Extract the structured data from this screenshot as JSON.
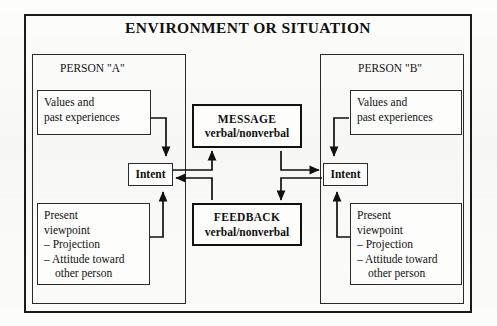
{
  "diagram": {
    "title": "ENVIRONMENT OR SITUATION",
    "person_a": {
      "label": "PERSON \"A\"",
      "values_box": {
        "line1": "Values and",
        "line2": "past experiences"
      },
      "intent_box": "Intent",
      "present_box": {
        "line1": "Present",
        "line2": "viewpoint",
        "line3": "– Projection",
        "line4": "– Attitude toward",
        "line5": "other person"
      }
    },
    "person_b": {
      "label": "PERSON \"B\"",
      "values_box": {
        "line1": "Values and",
        "line2": "past experiences"
      },
      "intent_box": "Intent",
      "present_box": {
        "line1": "Present",
        "line2": "viewpoint",
        "line3": "– Projection",
        "line4": "– Attitude toward",
        "line5": "other person"
      }
    },
    "center": {
      "message": {
        "heading": "MESSAGE",
        "subtitle": "verbal/nonverbal"
      },
      "feedback": {
        "heading": "FEEDBACK",
        "subtitle": "verbal/nonverbal"
      }
    },
    "colors": {
      "ink": "#111111",
      "paper": "#fbfbfa",
      "frame": "#1b1b1b"
    },
    "connectors": [
      {
        "name": "values-a-to-intent-a",
        "from": "Values and past experiences (A)",
        "to": "Intent (A)",
        "direction": "down"
      },
      {
        "name": "present-a-to-intent-a",
        "from": "Present viewpoint (A)",
        "to": "Intent (A)",
        "direction": "up"
      },
      {
        "name": "intent-a-to-message",
        "from": "Intent (A)",
        "to": "MESSAGE",
        "direction": "up"
      },
      {
        "name": "message-to-intent-b",
        "from": "MESSAGE",
        "to": "Intent (B)",
        "direction": "right"
      },
      {
        "name": "intent-b-to-feedback",
        "from": "Intent (B)",
        "to": "FEEDBACK",
        "direction": "down"
      },
      {
        "name": "feedback-to-intent-a",
        "from": "FEEDBACK",
        "to": "Intent (A)",
        "direction": "left"
      },
      {
        "name": "values-b-to-intent-b",
        "from": "Values and past experiences (B)",
        "to": "Intent (B)",
        "direction": "down"
      },
      {
        "name": "present-b-to-intent-b",
        "from": "Present viewpoint (B)",
        "to": "Intent (B)",
        "direction": "up"
      }
    ]
  }
}
